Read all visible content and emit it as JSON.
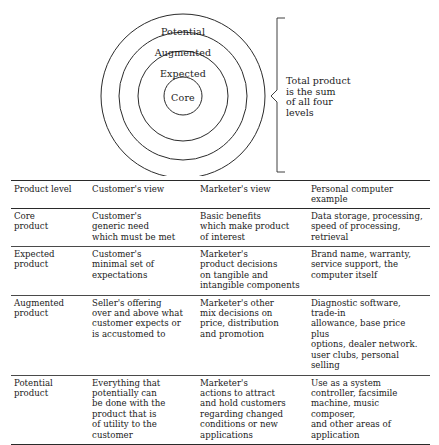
{
  "diagram": {
    "name": "total-product-concept-diagram",
    "rings": [
      {
        "label": "Potential",
        "label_x": 183,
        "label_y": 31,
        "radius": 82
      },
      {
        "label": "Augmented",
        "label_x": 183,
        "label_y": 52,
        "radius": 64
      },
      {
        "label": "Expected",
        "label_x": 183,
        "label_y": 73,
        "radius": 45
      },
      {
        "label": "Core",
        "label_x": 183,
        "label_y": 97,
        "radius": 19
      }
    ],
    "center": {
      "x": 183,
      "y": 96
    },
    "bracket": {
      "caption": "Total product\nis the sum\nof all four\nlevels",
      "top_y": 18,
      "bottom_y": 172,
      "x": 277,
      "pointer_y": 96
    },
    "stroke_color": "#2b2b2b"
  },
  "table": {
    "name": "product-levels-table",
    "headers": [
      "Product level",
      "Customer's view",
      "Marketer's view",
      "Personal computer example"
    ],
    "rows": [
      {
        "level": "Core\nproduct",
        "customer_view": "Customer's\ngeneric need\nwhich must be met",
        "marketer_view": "Basic benefits\nwhich make product\nof interest",
        "example": "Data storage, processing,\nspeed of processing,\nretrieval"
      },
      {
        "level": "Expected\nproduct",
        "customer_view": "Customer's\nminimal set of\nexpectations",
        "marketer_view": "Marketer's\nproduct decisions\non tangible and\nintangible components",
        "example": "Brand name, warranty,\nservice support, the\ncomputer itself"
      },
      {
        "level": "Augmented\nproduct",
        "customer_view": "Seller's offering\nover and above what\ncustomer expects or\nis accustomed to",
        "marketer_view": "Marketer's other\nmix decisions on\nprice, distribution\nand promotion",
        "example": "Diagnostic software, trade-in\nallowance, base price plus\noptions, dealer network.\nuser clubs, personal selling"
      },
      {
        "level": "Potential\nproduct",
        "customer_view": "Everything that\npotentially can\nbe done with the\nproduct that is\nof utility to the\ncustomer",
        "marketer_view": "Marketer's\nactions to attract\nand hold customers\nregarding changed\nconditions or new\napplications",
        "example": "Use as a system\ncontroller, facsimile\nmachine, music composer,\nand other areas of\napplication"
      }
    ]
  }
}
